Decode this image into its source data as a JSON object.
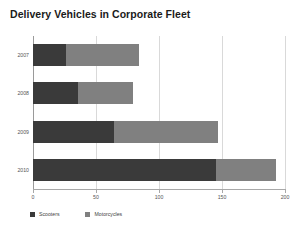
{
  "chart_data": {
    "type": "bar",
    "orientation": "horizontal",
    "stacked": true,
    "title": "Delivery Vehicles in Corporate Fleet",
    "xlabel": "",
    "ylabel": "",
    "categories": [
      "2007",
      "2008",
      "2009",
      "2010"
    ],
    "series": [
      {
        "name": "Scooters",
        "color": "#3a3a3a",
        "values": [
          26,
          36,
          64,
          145
        ]
      },
      {
        "name": "Motorcycles",
        "color": "#808080",
        "values": [
          58,
          43,
          83,
          48
        ]
      }
    ],
    "totals": [
      84,
      79,
      147,
      193
    ],
    "xlim": [
      0,
      200
    ],
    "xticks": [
      0,
      50,
      100,
      150,
      200
    ],
    "xtick_labels": [
      "0",
      "50",
      "100",
      "150",
      "200"
    ],
    "grid": true,
    "legend_position": "bottom-left"
  },
  "legend": {
    "entries": [
      {
        "label": "Scooters",
        "color": "#3a3a3a"
      },
      {
        "label": "Motorcycles",
        "color": "#808080"
      }
    ]
  }
}
